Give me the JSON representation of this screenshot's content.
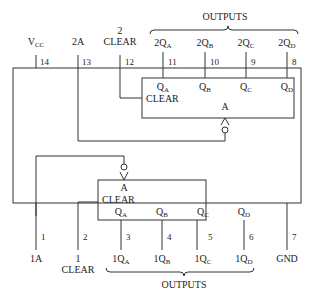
{
  "diagram": {
    "top": {
      "outputs_label": "OUTPUTS",
      "vcc": {
        "main": "V",
        "sub": "CC",
        "pin": "14"
      },
      "in_2a": {
        "label": "2A",
        "pin": "13"
      },
      "clear2": {
        "num": "2",
        "label": "CLEAR",
        "pin": "12"
      },
      "q": [
        {
          "prefix": "2Q",
          "sub": "A",
          "pin": "11"
        },
        {
          "prefix": "2Q",
          "sub": "B",
          "pin": "10"
        },
        {
          "prefix": "2Q",
          "sub": "C",
          "pin": "9"
        },
        {
          "prefix": "2Q",
          "sub": "D",
          "pin": "8"
        }
      ]
    },
    "counter2": {
      "clear_label": "CLEAR",
      "clock_label": "A",
      "q": [
        {
          "prefix": "Q",
          "sub": "A"
        },
        {
          "prefix": "Q",
          "sub": "B"
        },
        {
          "prefix": "Q",
          "sub": "C"
        },
        {
          "prefix": "Q",
          "sub": "D"
        }
      ]
    },
    "counter1": {
      "clear_label": "CLEAR",
      "clock_label": "A",
      "q": [
        {
          "prefix": "Q",
          "sub": "A"
        },
        {
          "prefix": "Q",
          "sub": "B"
        },
        {
          "prefix": "Q",
          "sub": "C"
        },
        {
          "prefix": "Q",
          "sub": "D"
        }
      ]
    },
    "bottom": {
      "outputs_label": "OUTPUTS",
      "in_1a": {
        "label": "1A",
        "pin": "1"
      },
      "clear1": {
        "num": "1",
        "label": "CLEAR",
        "pin": "2"
      },
      "q": [
        {
          "prefix": "1Q",
          "sub": "A",
          "pin": "3"
        },
        {
          "prefix": "1Q",
          "sub": "B",
          "pin": "4"
        },
        {
          "prefix": "1Q",
          "sub": "C",
          "pin": "5"
        },
        {
          "prefix": "1Q",
          "sub": "D",
          "pin": "6"
        }
      ],
      "gnd": {
        "label": "GND",
        "pin": "7"
      }
    }
  }
}
